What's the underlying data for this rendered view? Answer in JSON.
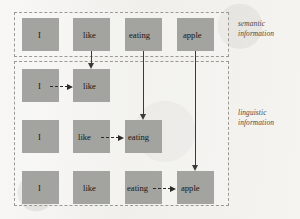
{
  "figure": {
    "panels": [
      {
        "id": "semantic",
        "label_line1": "semantic",
        "label_line2": "information"
      },
      {
        "id": "linguistic",
        "label_line1": "linguistic",
        "label_line2": "information"
      }
    ],
    "node_fill_color": "#a3a3a0",
    "panel_border_color": "#9a9a93",
    "arrow_color": "#2c2b28",
    "rows": [
      {
        "id": "row-semantic",
        "panel": "semantic",
        "nodes": [
          {
            "id": "sem-i",
            "label": "I"
          },
          {
            "id": "sem-like",
            "label": "like"
          },
          {
            "id": "sem-eating",
            "label": "eating"
          },
          {
            "id": "sem-apple",
            "label": "apple"
          }
        ]
      },
      {
        "id": "row-1",
        "panel": "linguistic",
        "nodes": [
          {
            "id": "r1-i",
            "label": "I"
          },
          {
            "id": "r1-like",
            "label": "like"
          }
        ]
      },
      {
        "id": "row-2",
        "panel": "linguistic",
        "nodes": [
          {
            "id": "r2-i",
            "label": "I"
          },
          {
            "id": "r2-like",
            "label": "like"
          },
          {
            "id": "r2-eating",
            "label": "eating"
          }
        ]
      },
      {
        "id": "row-3",
        "panel": "linguistic",
        "nodes": [
          {
            "id": "r3-i",
            "label": "I"
          },
          {
            "id": "r3-like",
            "label": "like"
          },
          {
            "id": "r3-eating",
            "label": "eating"
          },
          {
            "id": "r3-apple",
            "label": "apple"
          }
        ]
      }
    ],
    "vertical_arrows": [
      {
        "id": "v-like",
        "from": "sem-like",
        "to": "r1-like",
        "style": "solid"
      },
      {
        "id": "v-eating",
        "from": "sem-eating",
        "to": "r2-eating",
        "style": "solid"
      },
      {
        "id": "v-apple",
        "from": "sem-apple",
        "to": "r3-apple",
        "style": "solid"
      }
    ],
    "horizontal_arrows": [
      {
        "id": "h-r1",
        "from": "r1-i",
        "to": "r1-like",
        "style": "dashed"
      },
      {
        "id": "h-r2",
        "from": "r2-like",
        "to": "r2-eating",
        "style": "dashed"
      },
      {
        "id": "h-r3",
        "from": "r3-eating",
        "to": "r3-apple",
        "style": "dashed"
      }
    ]
  }
}
